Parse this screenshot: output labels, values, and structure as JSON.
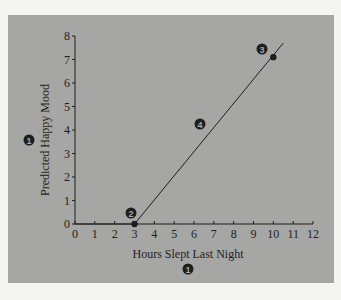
{
  "chart_data": {
    "type": "line",
    "title": "",
    "xlabel": "Hours Slept Last Night",
    "ylabel": "Predicted Happy Mood",
    "xlim": [
      0,
      12
    ],
    "ylim": [
      0,
      8
    ],
    "x_ticks": [
      "0",
      "1",
      "2",
      "3",
      "4",
      "5",
      "6",
      "7",
      "8",
      "9",
      "10",
      "11",
      "12"
    ],
    "y_ticks": [
      "0",
      "1",
      "2",
      "3",
      "4",
      "5",
      "6",
      "7",
      "8"
    ],
    "grid": false,
    "legend": null,
    "series": [
      {
        "name": "Prediction line",
        "x": [
          0,
          3,
          10.5
        ],
        "y": [
          0,
          0,
          7.7
        ]
      }
    ],
    "points": [
      {
        "x": 3,
        "y": 0
      },
      {
        "x": 10,
        "y": 7.1
      }
    ],
    "annotations": [
      {
        "label": "1",
        "target": "y-axis label"
      },
      {
        "label": "1",
        "target": "x-axis label"
      },
      {
        "label": "2",
        "x": 3,
        "y": 0
      },
      {
        "label": "3",
        "x": 10,
        "y": 7.1
      },
      {
        "label": "4",
        "target": "slope of line"
      }
    ]
  },
  "axes": {
    "xlabel": "Hours Slept Last Night",
    "ylabel": "Predicted Happy Mood"
  },
  "markers": {
    "y_axis_marker": "1",
    "x_axis_marker": "1",
    "intercept_marker": "2",
    "point_marker": "3",
    "slope_marker": "4"
  },
  "colors": {
    "panel": "#a6a6a5",
    "ink": "#1e1e1e"
  }
}
